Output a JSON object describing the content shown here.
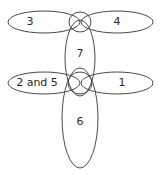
{
  "diagram": {
    "stroke_color": "#4a4a4a",
    "background": "#ffffff",
    "regions": [
      {
        "id": "r3",
        "label": "3",
        "shape": "ellipse",
        "cx": 44,
        "cy": 22,
        "rx": 36,
        "ry": 11,
        "label_x": 30,
        "label_y": 22
      },
      {
        "id": "r4",
        "label": "4",
        "shape": "ellipse",
        "cx": 117,
        "cy": 22,
        "rx": 36,
        "ry": 11,
        "label_x": 117,
        "label_y": 22
      },
      {
        "id": "r7",
        "label": "7",
        "shape": "ellipse",
        "cx": 80,
        "cy": 58,
        "rx": 15,
        "ry": 38,
        "label_x": 80,
        "label_y": 54
      },
      {
        "id": "r2and5",
        "label": "2 and 5",
        "shape": "ellipse",
        "cx": 44,
        "cy": 83,
        "rx": 36,
        "ry": 11,
        "label_x": 37,
        "label_y": 83
      },
      {
        "id": "r1",
        "label": "1",
        "shape": "ellipse",
        "cx": 117,
        "cy": 83,
        "rx": 36,
        "ry": 11,
        "label_x": 122,
        "label_y": 83
      },
      {
        "id": "r6",
        "label": "6",
        "shape": "ellipse",
        "cx": 80,
        "cy": 118,
        "rx": 18,
        "ry": 50,
        "label_x": 80,
        "label_y": 122
      }
    ],
    "junction_circles": [
      {
        "id": "top-junction",
        "cx": 80,
        "cy": 22,
        "rx": 11,
        "ry": 10
      },
      {
        "id": "middle-junction",
        "cx": 80,
        "cy": 83,
        "rx": 12,
        "ry": 11
      }
    ]
  }
}
